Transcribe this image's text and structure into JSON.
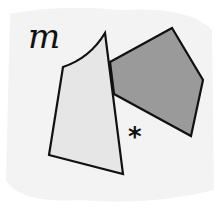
{
  "diagram": {
    "background": "#f3f3f3",
    "label_m": "m",
    "label_star": "*",
    "shapes": {
      "light_quadrilateral": {
        "fill": "#e6e6e6",
        "stroke": "#111111"
      },
      "dark_pentagon": {
        "fill": "#9a9a9a",
        "stroke": "#111111"
      }
    }
  }
}
